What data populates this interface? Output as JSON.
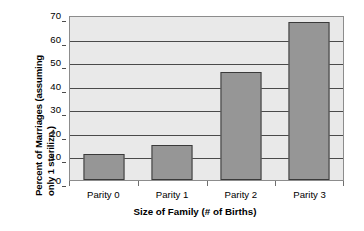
{
  "chart_data": {
    "type": "bar",
    "title": "",
    "categories": [
      "Parity 0",
      "Parity 1",
      "Parity 2",
      "Parity 3"
    ],
    "values": [
      11,
      15,
      46,
      67
    ],
    "xlabel": "Size of Family (# of Births)",
    "ylabel_line1": "Percent of Marriages (assuming",
    "ylabel_line2": "only 1 sterilizn.)",
    "ylabel": "Percent of Marriages (assuming only 1 sterilizn.)",
    "ylim": [
      0,
      70
    ],
    "yticks": [
      0,
      10,
      20,
      30,
      40,
      50,
      60,
      70
    ],
    "ytick_labels": [
      "0",
      "10",
      "20",
      "30",
      "40",
      "50",
      "60",
      "70"
    ],
    "grid": true,
    "legend": false,
    "bar_color": "#969696",
    "bar_border_color": "#3a3a3a",
    "plot_background": "#e9e9e9",
    "gridline_color": "#4a4a4a",
    "axis_color": "#8c8c8c"
  }
}
